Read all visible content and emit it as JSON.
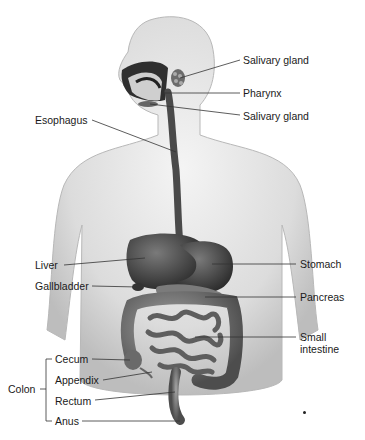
{
  "diagram": {
    "labels": {
      "salivary_gland_upper": "Salivary gland",
      "pharynx": "Pharynx",
      "salivary_gland_lower": "Salivary gland",
      "esophagus": "Esophagus",
      "liver": "Liver",
      "gallbladder": "Gallbladder",
      "stomach": "Stomach",
      "pancreas": "Pancreas",
      "small_intestine_line1": "Small",
      "small_intestine_line2": "intestine",
      "colon": "Colon",
      "cecum": "Cecum",
      "appendix": "Appendix",
      "rectum": "Rectum",
      "anus": "Anus"
    },
    "colors": {
      "skin_light": "#eeeeee",
      "skin_mid": "#c9c9c9",
      "organ_dark": "#3a3a3a",
      "organ_mid": "#6a6a6a",
      "intestine": "#8a8a8a",
      "leader_line": "#333333"
    }
  }
}
